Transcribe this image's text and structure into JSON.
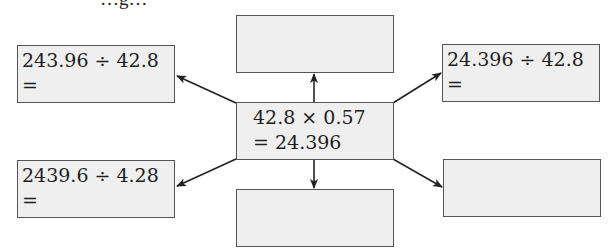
{
  "header": {
    "cropped_text": "…g…"
  },
  "center": {
    "line1": "42.8 × 0.57",
    "line2": "= 24.396"
  },
  "boxes": {
    "top_left": {
      "line1": "243.96 ÷ 42.8",
      "line2": "="
    },
    "bottom_left": {
      "line1": "2439.6 ÷ 4.28",
      "line2": "="
    },
    "top_right": {
      "line1": "24.396 ÷ 42.8",
      "line2": "="
    },
    "top_center": {
      "line1": "",
      "line2": ""
    },
    "bottom_center": {
      "line1": "",
      "line2": ""
    },
    "bottom_right": {
      "line1": "",
      "line2": ""
    }
  },
  "colors": {
    "box_fill": "#efefef",
    "box_border": "#555555",
    "arrow": "#222222",
    "text": "#1e1e1e"
  }
}
